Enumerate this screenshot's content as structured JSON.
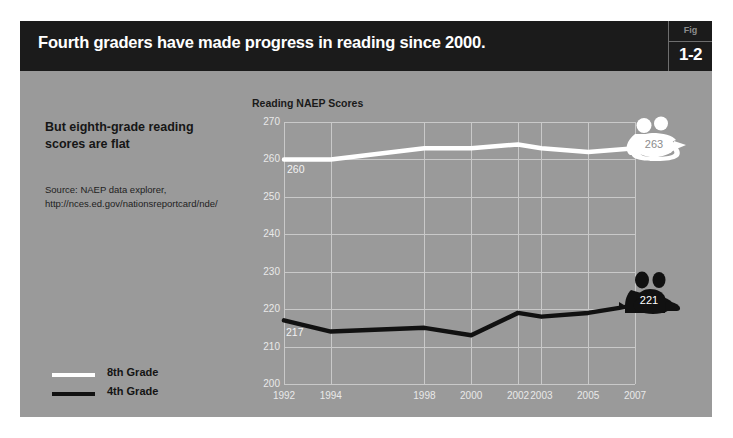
{
  "header": {
    "title": "Fourth graders have made progress in reading since 2000.",
    "fig_label": "Fig",
    "fig_number": "1-2"
  },
  "sidebar": {
    "subhead": "But eighth-grade reading scores are flat",
    "source_line1": "Source: NAEP data explorer,",
    "source_line2": "http://nces.ed.gov/nationsreportcard/nde/"
  },
  "legend": {
    "items": [
      {
        "label": "8th Grade",
        "color": "#ffffff",
        "style": "white"
      },
      {
        "label": "4th Grade",
        "color": "#111111",
        "style": "black"
      }
    ]
  },
  "colors": {
    "slide_background": "#9a9a9a",
    "header_background": "#1b1b1b",
    "grid": "#c9c9c9",
    "axis_text": "#e9e9e9",
    "series_8th": "#ffffff",
    "series_4th": "#111111"
  },
  "markers": [
    {
      "name": "263",
      "value": "263",
      "series": "8th Grade",
      "text_color": "#8c8c8c"
    },
    {
      "name": "221",
      "value": "221",
      "series": "4th Grade",
      "text_color": "#ffffff"
    }
  ],
  "start_labels": {
    "eighth": "260",
    "fourth": "217"
  },
  "chart_data": {
    "type": "line",
    "title": "Reading NAEP Scores",
    "xlabel": "",
    "ylabel": "",
    "grid": true,
    "legend_position": "bottom-left-outside",
    "x": [
      1992,
      1994,
      1998,
      2000,
      2002,
      2003,
      2005,
      2007
    ],
    "categories": [
      "1992",
      "1994",
      "1998",
      "2000",
      "2002",
      "2003",
      "2005",
      "2007"
    ],
    "xlim": [
      1992,
      2007
    ],
    "ylim": [
      200,
      270
    ],
    "yticks": [
      270,
      260,
      250,
      240,
      230,
      220,
      210,
      200
    ],
    "xticks": [
      "1992",
      "1994",
      "1998",
      "2000",
      "2002",
      "2003",
      "2005",
      "2007"
    ],
    "series": [
      {
        "name": "8th Grade",
        "color": "#ffffff",
        "values": [
          260,
          260,
          263,
          263,
          264,
          263,
          262,
          263
        ],
        "start_label": "260",
        "end_label": "263"
      },
      {
        "name": "4th Grade",
        "color": "#111111",
        "values": [
          217,
          214,
          215,
          213,
          219,
          218,
          219,
          221
        ],
        "start_label": "217",
        "end_label": "221"
      }
    ]
  }
}
